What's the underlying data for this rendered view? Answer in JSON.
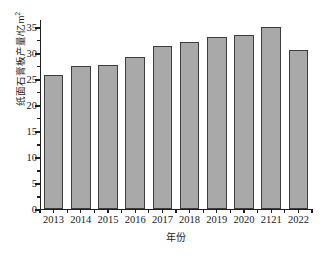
{
  "chart_data": {
    "type": "bar",
    "title": "",
    "subtitle": "",
    "xlabel": "年份",
    "ylabel": "纸面石膏板产量/亿m²",
    "ylabel_main": "纸面石膏板产量/亿m",
    "ylabel_superscript": "2",
    "categories": [
      "2013",
      "2014",
      "2015",
      "2016",
      "2017",
      "2018",
      "2019",
      "2020",
      "2121",
      "2022"
    ],
    "values": [
      25.8,
      27.5,
      27.7,
      29.2,
      31.4,
      32.1,
      33.2,
      33.5,
      35.1,
      30.7
    ],
    "series": [
      {
        "name": "纸面石膏板产量",
        "values": [
          25.8,
          27.5,
          27.7,
          29.2,
          31.4,
          32.1,
          33.2,
          33.5,
          35.1,
          30.7
        ]
      }
    ],
    "ylim": [
      0,
      36.5
    ],
    "y_major_ticks": [
      0,
      5,
      10,
      15,
      20,
      25,
      30,
      35
    ],
    "y_minor_tick_interval": 2.5,
    "y_tick_labels": [
      "0",
      "5",
      "10",
      "15",
      "20",
      "25",
      "30",
      "35"
    ],
    "grid": false,
    "legend": "none",
    "bar_fill_color": "#a9a9a9",
    "bar_edge_color": "#3d3d3d",
    "axis_color": "#202020",
    "background_color": "#ffffff"
  }
}
